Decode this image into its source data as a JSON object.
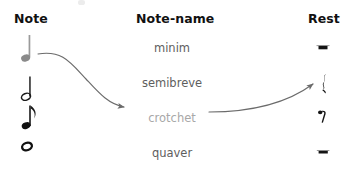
{
  "diagram": {
    "background_color": "#ffffff"
  },
  "headers": {
    "note": "Note",
    "note_name": "Note-name",
    "rest": "Rest"
  },
  "columns": {
    "notes": [
      {
        "glyph_name": "crotchet-note",
        "label": "crotchet note",
        "color": "#8a8a8a",
        "head": "filled",
        "flag": false,
        "stem": true
      },
      {
        "glyph_name": "minim-note",
        "label": "minim note",
        "color": "#1a1a1a",
        "head": "hollow",
        "flag": false,
        "stem": true
      },
      {
        "glyph_name": "quaver-note",
        "label": "quaver note",
        "color": "#1a1a1a",
        "head": "filled",
        "flag": true,
        "stem": true
      },
      {
        "glyph_name": "semibreve-note",
        "label": "semibreve note",
        "color": "#1a1a1a",
        "head": "hollow",
        "flag": false,
        "stem": false
      }
    ],
    "note_names": [
      {
        "text": "minim",
        "highlighted": false
      },
      {
        "text": "semibreve",
        "highlighted": false
      },
      {
        "text": "crotchet",
        "highlighted": true
      },
      {
        "text": "quaver",
        "highlighted": false
      }
    ],
    "rests": [
      {
        "glyph_name": "minim-rest",
        "label": "minim rest",
        "color": "#1a1a1a"
      },
      {
        "glyph_name": "crotchet-rest",
        "label": "crotchet rest",
        "color": "#1a1a1a"
      },
      {
        "glyph_name": "quaver-rest",
        "label": "quaver rest",
        "color": "#1a1a1a"
      },
      {
        "glyph_name": "semibreve-rest",
        "label": "semibreve rest",
        "color": "#1a1a1a"
      }
    ]
  },
  "connectors": [
    {
      "name": "arrow-note-to-crotchet",
      "from": "crotchet-note",
      "to": "crotchet-label",
      "color": "#6b6b6b",
      "has_arrowhead": true
    },
    {
      "name": "arrow-crotchet-to-rest",
      "from": "crotchet-label",
      "to": "crotchet-rest",
      "color": "#6b6b6b",
      "has_arrowhead": true
    }
  ],
  "colors": {
    "header_text": "#111111",
    "body_text": "#5e5e5e",
    "highlight_text": "#a8a8a8",
    "connector": "#6b6b6b",
    "glyph_dark": "#1a1a1a",
    "glyph_gray": "#8a8a8a"
  }
}
